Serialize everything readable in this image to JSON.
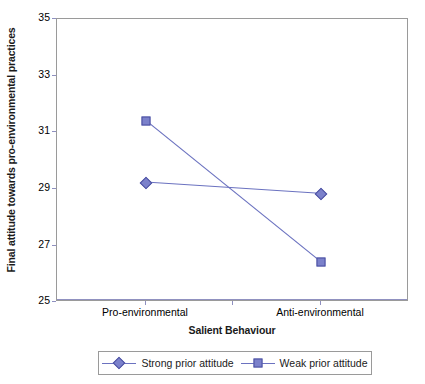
{
  "chart_data": {
    "type": "line",
    "title": "",
    "subtitle": "",
    "xlabel": "Salient Behaviour",
    "ylabel": "Final attitude towards pro-environmental practices",
    "categories": [
      "Pro-environmental",
      "Anti-environmental"
    ],
    "ylim": [
      25,
      35
    ],
    "yticks": [
      25,
      27,
      29,
      31,
      33,
      35
    ],
    "ytick_labels": [
      "25",
      "27",
      "29",
      "31",
      "33",
      "35"
    ],
    "grid": false,
    "legend_position": "bottom",
    "series": [
      {
        "name": "Strong prior attitude",
        "marker": "diamond",
        "color": "#6b72c0",
        "values": [
          29.2,
          28.8
        ]
      },
      {
        "name": "Weak prior attitude",
        "marker": "square",
        "color": "#6b72c0",
        "values": [
          31.4,
          26.4
        ]
      }
    ]
  },
  "axes": {
    "y_title": "Final attitude towards pro-environmental practices",
    "x_title": "Salient Behaviour",
    "y_tick_labels": [
      "35",
      "33",
      "31",
      "29",
      "27",
      "25"
    ],
    "x_tick_labels": [
      "Pro-environmental",
      "Anti-environmental"
    ]
  },
  "legend": {
    "entries": [
      {
        "label": "Strong prior attitude",
        "marker": "diamond-marker-icon"
      },
      {
        "label": "Weak prior attitude",
        "marker": "square-marker-icon"
      }
    ]
  },
  "colors": {
    "series_line": "#6b72c0",
    "marker_fill": "#7b81cb",
    "marker_stroke": "#4a4fa0",
    "axis_border": "#9a9a9a",
    "background": "#ffffff"
  }
}
